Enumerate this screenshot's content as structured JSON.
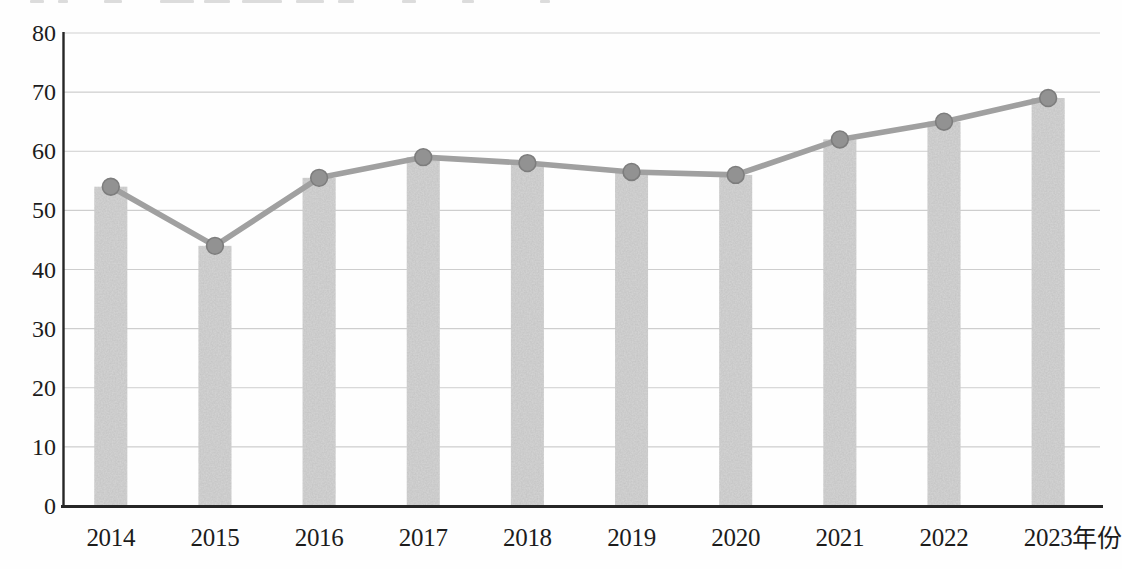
{
  "chart_data": {
    "type": "combo-bar-line",
    "title": "",
    "xlabel": "年份",
    "ylabel": "",
    "categories": [
      "2014",
      "2015",
      "2016",
      "2017",
      "2018",
      "2019",
      "2020",
      "2021",
      "2022",
      "2023"
    ],
    "series": [
      {
        "name": "bars",
        "type": "bar",
        "values": [
          54,
          44,
          55.5,
          59,
          58,
          56.5,
          56,
          62,
          65,
          69
        ]
      },
      {
        "name": "line",
        "type": "line",
        "values": [
          54,
          44,
          55.5,
          59,
          58,
          56.5,
          56,
          62,
          65,
          69
        ]
      }
    ],
    "ylim": [
      0,
      80
    ],
    "ytick_step": 10,
    "yticks": [
      "0",
      "10",
      "20",
      "30",
      "40",
      "50",
      "60",
      "70",
      "80"
    ],
    "grid": true,
    "legend": "none",
    "colors": {
      "bar": "#d5d5d5",
      "line": "#a0a0a0",
      "marker": "#929292",
      "marker_edge": "#7d7d7d",
      "gridline": "#c9c9c9",
      "axis": "#262626",
      "text": "#1c1c1c",
      "background": "#fefefe"
    }
  }
}
